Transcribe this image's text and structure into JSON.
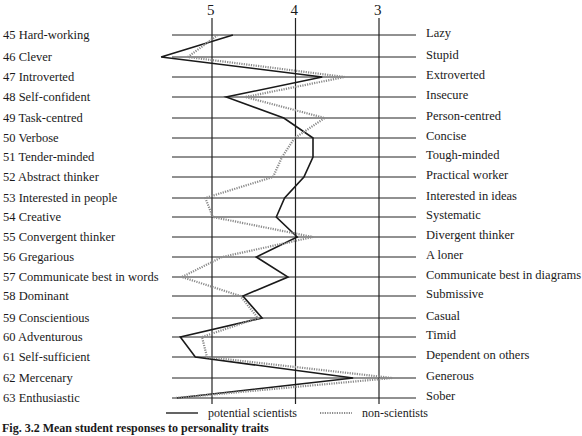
{
  "chart_data": {
    "type": "line",
    "orientation": "horizontal-profile",
    "title": "",
    "xlabel": "",
    "ylabel": "",
    "x_ticks": [
      "5",
      "4",
      "3"
    ],
    "x_tick_values": [
      5,
      4,
      3
    ],
    "xlim": [
      5.7,
      2.6
    ],
    "grid": true,
    "legend_position": "bottom",
    "left_labels": [
      "45 Hard-working",
      "46 Clever",
      "47 Introverted",
      "48 Self-confident",
      "49 Task-centred",
      "50 Verbose",
      "51 Tender-minded",
      "52 Abstract thinker",
      "53 Interested in people",
      "54 Creative",
      "55 Convergent thinker",
      "56 Gregarious",
      "57 Communicate best in words",
      "58 Dominant",
      "59 Conscientious",
      "60 Adventurous",
      "61 Self-sufficient",
      "62 Mercenary",
      "63 Enthusiastic"
    ],
    "right_labels": [
      "Lazy",
      "Stupid",
      "Extroverted",
      "Insecure",
      "Person-centred",
      "Concise",
      "Tough-minded",
      "Practical worker",
      "Interested in ideas",
      "Systematic",
      "Divergent thinker",
      "A loner",
      "Communicate best in diagrams",
      "Submissive",
      "Casual",
      "Timid",
      "Dependent on others",
      "Generous",
      "Sober"
    ],
    "series": [
      {
        "name": "potential scientists",
        "style": "solid",
        "color": "#1a1a1a",
        "values": [
          4.75,
          5.61,
          3.68,
          4.83,
          4.14,
          3.79,
          3.79,
          3.9,
          4.13,
          4.23,
          3.98,
          4.47,
          4.09,
          4.63,
          4.4,
          5.38,
          5.2,
          3.31,
          5.42
        ]
      },
      {
        "name": "non-scientists",
        "style": "dotted",
        "color": "#8a8a8a",
        "values": [
          4.93,
          5.29,
          3.41,
          4.6,
          3.65,
          4.01,
          4.16,
          4.27,
          5.08,
          4.99,
          3.79,
          4.88,
          5.36,
          4.66,
          4.45,
          5.12,
          5.06,
          2.84,
          5.44
        ]
      }
    ]
  },
  "legend": {
    "solid_label": "potential scientists",
    "dotted_label": "non-scientists"
  },
  "caption": "Fig. 3.2   Mean student responses to personality traits"
}
